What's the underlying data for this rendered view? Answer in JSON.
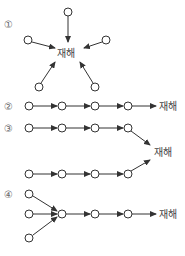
{
  "diagram": {
    "target_label": "재해",
    "panels": [
      {
        "id": "1",
        "marker": "①",
        "type": "simultaneous",
        "label": "재해"
      },
      {
        "id": "2",
        "marker": "②",
        "type": "chain",
        "label": "재해"
      },
      {
        "id": "3",
        "marker": "③",
        "type": "compound-chain",
        "label": "재해"
      },
      {
        "id": "4",
        "marker": "④",
        "type": "mixed",
        "label": "재해"
      }
    ]
  }
}
